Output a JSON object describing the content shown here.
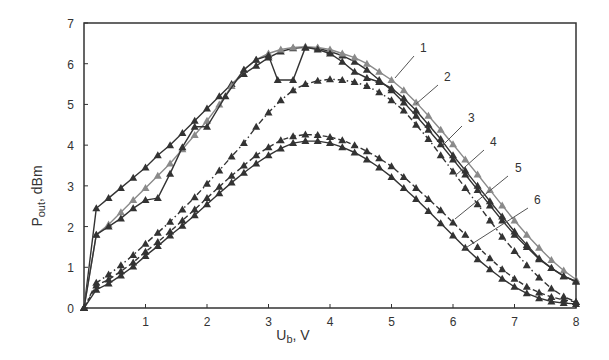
{
  "chart_data": {
    "type": "line",
    "title": "",
    "xlabel": "U_b, V",
    "xlabel_main": "U",
    "xlabel_sub": "b",
    "xlabel_unit": ", V",
    "ylabel": "P_out, dBm",
    "ylabel_main": "P",
    "ylabel_sub": "out",
    "ylabel_unit": ", dBm",
    "xlim": [
      0,
      8
    ],
    "ylim": [
      0,
      7
    ],
    "xticks": [
      1,
      2,
      3,
      4,
      5,
      6,
      7,
      8
    ],
    "yticks": [
      0,
      1,
      2,
      3,
      4,
      5,
      6,
      7
    ],
    "grid": false,
    "legend": "inline numbered labels 1-6 with leader lines",
    "series": [
      {
        "name": "1",
        "style": "solid",
        "color": "#333333",
        "x": [
          0,
          0.2,
          0.4,
          0.6,
          0.8,
          1.0,
          1.2,
          1.4,
          1.6,
          1.8,
          2.0,
          2.2,
          2.4,
          2.6,
          2.8,
          3.0,
          3.2,
          3.4,
          3.6,
          3.8,
          4.0,
          4.2,
          4.4,
          4.6,
          4.8,
          5.0,
          5.2,
          5.4,
          5.6,
          5.8,
          6.0,
          6.2,
          6.4,
          6.6,
          6.8,
          7.0,
          7.2,
          7.4,
          7.6,
          7.8,
          8.0
        ],
        "y": [
          0,
          2.45,
          2.7,
          2.95,
          3.2,
          3.45,
          3.75,
          4.0,
          4.3,
          4.6,
          4.9,
          5.2,
          5.5,
          5.75,
          5.95,
          6.15,
          6.3,
          6.38,
          6.4,
          6.38,
          6.3,
          6.2,
          6.05,
          5.85,
          5.6,
          5.35,
          5.05,
          4.72,
          4.38,
          4.02,
          3.65,
          3.28,
          2.9,
          2.52,
          2.15,
          1.8,
          1.5,
          1.2,
          0.98,
          0.78,
          0.65
        ]
      },
      {
        "name": "2",
        "style": "solid-gray",
        "color": "#8a8a8a",
        "x": [
          0,
          0.2,
          0.4,
          0.6,
          0.8,
          1.0,
          1.2,
          1.4,
          1.6,
          1.8,
          2.0,
          2.2,
          2.4,
          2.6,
          2.8,
          3.0,
          3.2,
          3.4,
          3.6,
          3.8,
          4.0,
          4.2,
          4.4,
          4.6,
          4.8,
          5.0,
          5.2,
          5.4,
          5.6,
          5.8,
          6.0,
          6.2,
          6.4,
          6.6,
          6.8,
          7.0,
          7.2,
          7.4,
          7.6,
          7.8,
          8.0
        ],
        "y": [
          0,
          1.8,
          2.05,
          2.35,
          2.65,
          2.95,
          3.25,
          3.55,
          3.9,
          4.25,
          4.6,
          5.0,
          5.45,
          5.85,
          6.1,
          6.25,
          6.35,
          6.4,
          6.42,
          6.4,
          6.35,
          6.25,
          6.15,
          6.0,
          5.8,
          5.6,
          5.35,
          5.05,
          4.72,
          4.38,
          4.02,
          3.65,
          3.28,
          2.9,
          2.52,
          2.15,
          1.8,
          1.48,
          1.18,
          0.92,
          0.7
        ]
      },
      {
        "name": "3",
        "style": "solid",
        "color": "#333333",
        "x": [
          0,
          0.2,
          0.4,
          0.6,
          0.8,
          1.0,
          1.2,
          1.4,
          1.6,
          1.8,
          2.0,
          2.3,
          2.6,
          2.8,
          3.0,
          3.15,
          3.4,
          3.6,
          3.8,
          4.0,
          4.2,
          4.4,
          4.6,
          4.8,
          5.0,
          5.2,
          5.4,
          5.6,
          5.8,
          6.0,
          6.2,
          6.4,
          6.6,
          6.8,
          7.0,
          7.2,
          7.4,
          7.6,
          7.8,
          8.0
        ],
        "y": [
          0,
          1.8,
          2.0,
          2.2,
          2.45,
          2.65,
          2.7,
          3.3,
          3.95,
          4.45,
          4.45,
          5.2,
          5.85,
          6.1,
          6.2,
          5.6,
          5.6,
          6.4,
          6.35,
          6.25,
          6.05,
          5.8,
          5.65,
          5.55,
          5.4,
          5.15,
          4.85,
          4.5,
          4.15,
          3.75,
          3.38,
          3.0,
          2.62,
          2.25,
          1.88,
          1.55,
          1.22,
          0.98,
          0.78,
          0.65
        ]
      },
      {
        "name": "4",
        "style": "dash-dot",
        "color": "#333333",
        "x": [
          0,
          0.2,
          0.4,
          0.6,
          0.8,
          1.0,
          1.2,
          1.4,
          1.6,
          1.8,
          2.0,
          2.2,
          2.4,
          2.6,
          2.8,
          3.0,
          3.2,
          3.4,
          3.6,
          3.8,
          4.0,
          4.2,
          4.4,
          4.6,
          4.8,
          5.0,
          5.2,
          5.4,
          5.6,
          5.8,
          6.0,
          6.2,
          6.4,
          6.6,
          6.8,
          7.0,
          7.2,
          7.4,
          7.6,
          7.8,
          8.0
        ],
        "y": [
          0,
          0.62,
          0.82,
          1.05,
          1.3,
          1.58,
          1.85,
          2.12,
          2.42,
          2.72,
          3.05,
          3.38,
          3.72,
          4.05,
          4.45,
          4.8,
          5.1,
          5.35,
          5.5,
          5.58,
          5.62,
          5.6,
          5.55,
          5.45,
          5.3,
          5.1,
          4.85,
          4.5,
          4.15,
          3.75,
          3.35,
          2.95,
          2.55,
          2.15,
          1.75,
          1.4,
          1.05,
          0.75,
          0.48,
          0.28,
          0.15
        ]
      },
      {
        "name": "5",
        "style": "dashed",
        "color": "#333333",
        "x": [
          0,
          0.2,
          0.4,
          0.6,
          0.8,
          1.0,
          1.2,
          1.4,
          1.6,
          1.8,
          2.0,
          2.2,
          2.4,
          2.6,
          2.8,
          3.0,
          3.2,
          3.4,
          3.6,
          3.8,
          4.0,
          4.2,
          4.4,
          4.6,
          4.8,
          5.0,
          5.2,
          5.4,
          5.6,
          5.8,
          6.0,
          6.2,
          6.4,
          6.6,
          6.8,
          7.0,
          7.2,
          7.4,
          7.6,
          7.8,
          8.0
        ],
        "y": [
          0,
          0.55,
          0.7,
          0.9,
          1.12,
          1.38,
          1.62,
          1.88,
          2.15,
          2.42,
          2.7,
          2.98,
          3.25,
          3.5,
          3.75,
          3.95,
          4.12,
          4.22,
          4.26,
          4.25,
          4.2,
          4.12,
          4.0,
          3.85,
          3.68,
          3.48,
          3.22,
          2.95,
          2.68,
          2.4,
          2.1,
          1.8,
          1.5,
          1.22,
          0.95,
          0.72,
          0.52,
          0.38,
          0.27,
          0.2,
          0.15
        ]
      },
      {
        "name": "6",
        "style": "solid",
        "color": "#333333",
        "x": [
          0,
          0.2,
          0.4,
          0.6,
          0.8,
          1.0,
          1.2,
          1.4,
          1.6,
          1.8,
          2.0,
          2.2,
          2.4,
          2.6,
          2.8,
          3.0,
          3.2,
          3.4,
          3.6,
          3.8,
          4.0,
          4.2,
          4.4,
          4.6,
          4.8,
          5.0,
          5.2,
          5.4,
          5.6,
          5.8,
          6.0,
          6.2,
          6.4,
          6.6,
          6.8,
          7.0,
          7.2,
          7.4,
          7.6,
          7.8,
          8.0
        ],
        "y": [
          0,
          0.45,
          0.6,
          0.8,
          1.02,
          1.28,
          1.52,
          1.78,
          2.02,
          2.28,
          2.55,
          2.82,
          3.08,
          3.32,
          3.55,
          3.75,
          3.92,
          4.05,
          4.1,
          4.1,
          4.05,
          3.95,
          3.82,
          3.65,
          3.45,
          3.22,
          2.95,
          2.68,
          2.38,
          2.08,
          1.78,
          1.48,
          1.2,
          0.95,
          0.72,
          0.52,
          0.36,
          0.24,
          0.16,
          0.12,
          0.1
        ]
      }
    ],
    "labels": [
      {
        "text": "1",
        "lx": 420,
        "ly": 52,
        "ax": 395,
        "ay": 78,
        "bx": 414,
        "by": 56
      },
      {
        "text": "2",
        "lx": 444,
        "ly": 81,
        "ax": 416,
        "ay": 104,
        "bx": 438,
        "by": 85
      },
      {
        "text": "3",
        "lx": 468,
        "ly": 122,
        "ax": 443,
        "ay": 145,
        "bx": 462,
        "by": 126
      },
      {
        "text": "4",
        "lx": 490,
        "ly": 146,
        "ax": 456,
        "ay": 175,
        "bx": 484,
        "by": 150
      },
      {
        "text": "5",
        "lx": 515,
        "ly": 172,
        "ax": 455,
        "ay": 219,
        "bx": 508,
        "by": 176
      },
      {
        "text": "6",
        "lx": 534,
        "ly": 204,
        "ax": 464,
        "ay": 249,
        "bx": 528,
        "by": 208
      }
    ]
  },
  "plot": {
    "left": 84,
    "right": 576,
    "top": 23,
    "bottom": 308,
    "frame_color": "#333333"
  }
}
